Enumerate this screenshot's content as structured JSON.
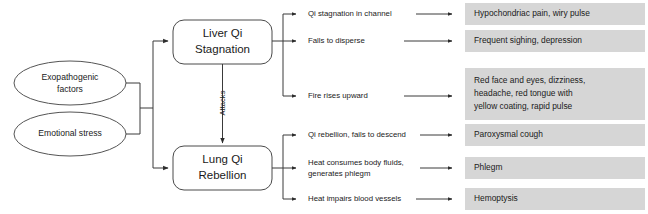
{
  "diagram": {
    "colors": {
      "symptom_box_fill": "#d6d6d6",
      "node_stroke": "#4a4a4a",
      "connector_stroke": "#3a3a3a",
      "text": "#1a1a1a",
      "background": "#ffffff"
    },
    "causes": [
      {
        "id": "exopathogenic",
        "label_line1": "Exopathogenic",
        "label_line2": "factors"
      },
      {
        "id": "emotional",
        "label_line1": "Emotional stress",
        "label_line2": ""
      }
    ],
    "patterns": [
      {
        "id": "liver-qi-stagnation",
        "label_line1": "Liver Qi",
        "label_line2": "Stagnation"
      },
      {
        "id": "lung-qi-rebellion",
        "label_line1": "Lung Qi",
        "label_line2": "Rebellion"
      }
    ],
    "relation_label": "Attacks",
    "branches": [
      {
        "id": "qi-stagnation-in-channel",
        "mechanism_line1": "Qi stagnation in channel",
        "mechanism_line2": "",
        "mechanism_line3": "",
        "symptom_line1": "Hypochondriac pain, wiry pulse",
        "symptom_line2": "",
        "symptom_line3": ""
      },
      {
        "id": "fails-to-disperse",
        "mechanism_line1": "Falls to disperse",
        "mechanism_line2": "",
        "mechanism_line3": "",
        "symptom_line1": "Frequent sighing, depression",
        "symptom_line2": "",
        "symptom_line3": ""
      },
      {
        "id": "fire-rises-upward",
        "mechanism_line1": "Fire rises upward",
        "mechanism_line2": "",
        "mechanism_line3": "",
        "symptom_line1": "Red face and eyes, dizziness,",
        "symptom_line2": "headache, red tongue with",
        "symptom_line3": "yellow coating, rapid pulse"
      },
      {
        "id": "qi-rebellion-fails-to-descend",
        "mechanism_line1": "Qi rebellion, fails to descend",
        "mechanism_line2": "",
        "mechanism_line3": "",
        "symptom_line1": "Paroxysmal cough",
        "symptom_line2": "",
        "symptom_line3": ""
      },
      {
        "id": "heat-consumes-body-fluids",
        "mechanism_line1": "Heat consumes body fluids,",
        "mechanism_line2": "generates phlegm",
        "mechanism_line3": "",
        "symptom_line1": "Phlegm",
        "symptom_line2": "",
        "symptom_line3": ""
      },
      {
        "id": "heat-impairs-blood-vessels",
        "mechanism_line1": "Heat impairs blood vessels",
        "mechanism_line2": "",
        "mechanism_line3": "",
        "symptom_line1": "Hemoptysis",
        "symptom_line2": "",
        "symptom_line3": ""
      }
    ]
  }
}
